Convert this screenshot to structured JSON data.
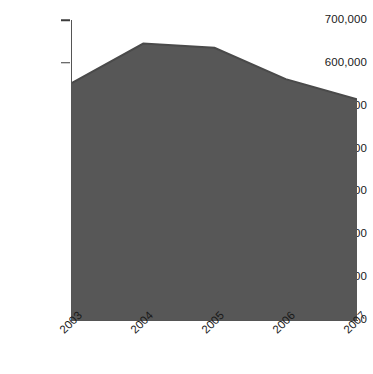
{
  "chart_data": {
    "type": "area",
    "title": "",
    "subtitle": "",
    "xlabel": "",
    "ylabel": "",
    "categories": [
      "2003",
      "2004",
      "2005",
      "2006",
      "2007"
    ],
    "values": [
      553000,
      645000,
      635000,
      562000,
      515000
    ],
    "series": [
      {
        "name": "Series 1",
        "values": [
          553000,
          645000,
          635000,
          562000,
          515000
        ]
      }
    ],
    "ylim": [
      0,
      700000
    ],
    "y_ticks": [
      0,
      100000,
      200000,
      300000,
      400000,
      500000,
      600000,
      700000
    ],
    "y_tick_labels": [
      "0",
      "100,000",
      "200,000",
      "300,000",
      "400,000",
      "500,000",
      "600,000",
      "700,000"
    ],
    "y_ticks_with_marks": [
      600000,
      700000
    ],
    "x_tick_labels": [
      "2003",
      "2004",
      "2005",
      "2006",
      "2007"
    ],
    "x_label_rotation_deg": -45,
    "grid": false,
    "legend": null,
    "legend_position": "none",
    "colors": {
      "area_fill": "#575757",
      "area_stroke": "#4a4a4a",
      "axis": "#555555",
      "tick_mark": "#3c3c3c",
      "text": "#1a1a1a",
      "background": "#ffffff"
    }
  },
  "layout": {
    "plot_left": 72,
    "plot_right": 357,
    "plot_top": 20,
    "plot_bottom": 320
  }
}
